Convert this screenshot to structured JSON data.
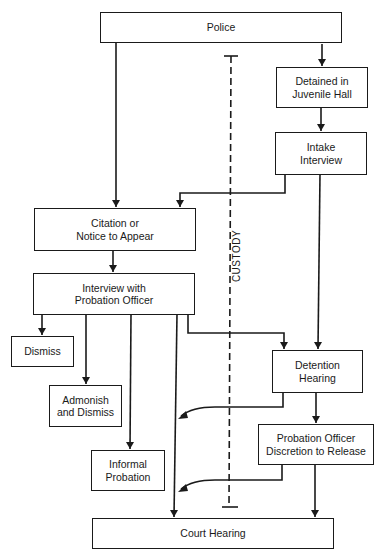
{
  "diagram": {
    "type": "flowchart",
    "nodes": {
      "police": "Police",
      "detained": "Detained in\nJuvenile Hall",
      "intake": "Intake\nInterview",
      "citation": "Citation or\nNotice to Appear",
      "interview": "Interview with\nProbation Officer",
      "dismiss": "Dismiss",
      "admonish": "Admonish\nand Dismiss",
      "informal": "Informal\nProbation",
      "detention": "Detention\nHearing",
      "po_discretion": "Probation Officer\nDiscretion to Release",
      "court": "Court Hearing"
    },
    "custody_label": "CUSTODY",
    "edges": [
      [
        "Police",
        "Citation or Notice to Appear"
      ],
      [
        "Police",
        "Detained in Juvenile Hall"
      ],
      [
        "Detained in Juvenile Hall",
        "Intake Interview"
      ],
      [
        "Intake Interview",
        "Citation or Notice to Appear"
      ],
      [
        "Intake Interview",
        "Detention Hearing"
      ],
      [
        "Citation or Notice to Appear",
        "Interview with Probation Officer"
      ],
      [
        "Interview with Probation Officer",
        "Dismiss"
      ],
      [
        "Interview with Probation Officer",
        "Admonish and Dismiss"
      ],
      [
        "Interview with Probation Officer",
        "Informal Probation"
      ],
      [
        "Interview with Probation Officer",
        "Court Hearing"
      ],
      [
        "Interview with Probation Officer",
        "Detention Hearing"
      ],
      [
        "Detention Hearing",
        "Court Hearing path (release)"
      ],
      [
        "Detention Hearing",
        "Probation Officer Discretion to Release"
      ],
      [
        "Probation Officer Discretion to Release",
        "Court Hearing path (release)"
      ],
      [
        "Probation Officer Discretion to Release",
        "Court Hearing"
      ]
    ]
  }
}
